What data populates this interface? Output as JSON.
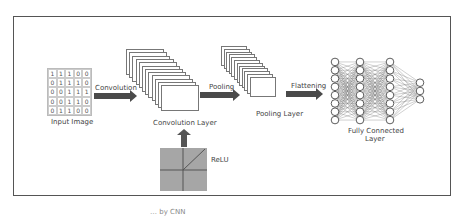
{
  "diagram": {
    "input": {
      "label": "Input Image",
      "matrix": [
        [
          "1",
          "1",
          "1",
          "0",
          "0"
        ],
        [
          "0",
          "1",
          "1",
          "1",
          "0"
        ],
        [
          "0",
          "0",
          "1",
          "1",
          "1"
        ],
        [
          "0",
          "0",
          "1",
          "1",
          "0"
        ],
        [
          "0",
          "1",
          "1",
          "0",
          "0"
        ]
      ]
    },
    "arrows": {
      "convolution": "Convolution",
      "pooling": "Pooling",
      "flattening": "Flattening"
    },
    "layers": {
      "convolution": "Convolution Layer",
      "pooling": "Pooling Layer",
      "fully_connected_line1": "Fully Connected",
      "fully_connected_line2": "Layer"
    },
    "activation": {
      "label": "ReLU"
    },
    "network": {
      "layer_sizes": [
        8,
        8,
        8,
        3
      ]
    }
  },
  "caption": "… by CNN"
}
